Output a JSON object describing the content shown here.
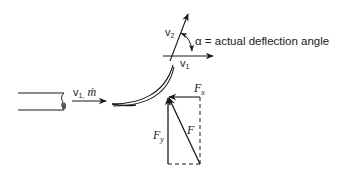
{
  "diagram": {
    "colors": {
      "stroke": "#1a1a1a",
      "background": "#ffffff"
    },
    "inlet": {
      "label_main": "v",
      "label_sub": "1,",
      "label_mdot": "ṁ"
    },
    "exit_triangle": {
      "v2_main": "v",
      "v2_sub": "2",
      "v1_main": "v",
      "v1_sub": "1",
      "alpha_label": "α = actual deflection angle"
    },
    "forces": {
      "fx_main": "F",
      "fx_sub": "x",
      "fy_main": "F",
      "fy_sub": "y",
      "f_main": "F"
    }
  }
}
